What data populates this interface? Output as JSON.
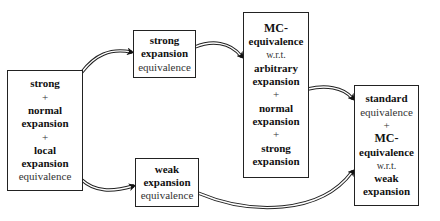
{
  "diagram": {
    "type": "flow",
    "nodes": [
      {
        "id": "combined",
        "lines": [
          {
            "text": "strong",
            "style": "bold"
          },
          {
            "text": "+",
            "style": "normal"
          },
          {
            "text": "normal",
            "style": "bold"
          },
          {
            "text": "expansion",
            "style": "bold"
          },
          {
            "text": "+",
            "style": "normal"
          },
          {
            "text": "local",
            "style": "bold"
          },
          {
            "text": "expansion",
            "style": "bold"
          },
          {
            "text": "equivalence",
            "style": "normal"
          }
        ]
      },
      {
        "id": "strong-expansion",
        "lines": [
          {
            "text": "strong",
            "style": "bold"
          },
          {
            "text": "expansion",
            "style": "bold"
          },
          {
            "text": "equivalence",
            "style": "normal"
          }
        ]
      },
      {
        "id": "weak-expansion",
        "lines": [
          {
            "text": "weak",
            "style": "bold"
          },
          {
            "text": "expansion",
            "style": "bold"
          },
          {
            "text": "equivalence",
            "style": "normal"
          }
        ]
      },
      {
        "id": "mc-arbitrary",
        "lines": [
          {
            "text": "MC-",
            "style": "bold"
          },
          {
            "text": "equivalence",
            "style": "bold"
          },
          {
            "text": "w.r.t.",
            "style": "normal"
          },
          {
            "text": "arbitrary",
            "style": "bold"
          },
          {
            "text": "expansion",
            "style": "bold"
          },
          {
            "text": "+",
            "style": "normal"
          },
          {
            "text": "normal",
            "style": "bold"
          },
          {
            "text": "expansion",
            "style": "bold"
          },
          {
            "text": "+",
            "style": "normal"
          },
          {
            "text": "strong",
            "style": "bold"
          },
          {
            "text": "expansion",
            "style": "bold"
          }
        ]
      },
      {
        "id": "standard-mc-weak",
        "lines": [
          {
            "text": "standard",
            "style": "bold"
          },
          {
            "text": "equivalence",
            "style": "normal"
          },
          {
            "text": "+",
            "style": "normal"
          },
          {
            "text": "MC-",
            "style": "bold"
          },
          {
            "text": "equivalence",
            "style": "bold"
          },
          {
            "text": "w.r.t.",
            "style": "normal"
          },
          {
            "text": "weak",
            "style": "bold"
          },
          {
            "text": "expansion",
            "style": "bold"
          }
        ]
      }
    ],
    "edges": [
      {
        "from": "combined",
        "to": "strong-expansion",
        "style": "double-line-implication"
      },
      {
        "from": "combined",
        "to": "weak-expansion",
        "style": "double-line-implication"
      },
      {
        "from": "strong-expansion",
        "to": "mc-arbitrary",
        "style": "double-line-implication"
      },
      {
        "from": "mc-arbitrary",
        "to": "standard-mc-weak",
        "style": "double-line-implication"
      },
      {
        "from": "weak-expansion",
        "to": "standard-mc-weak",
        "style": "double-line-implication"
      }
    ]
  }
}
